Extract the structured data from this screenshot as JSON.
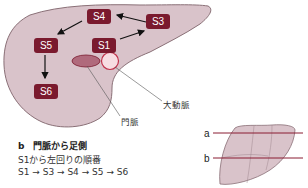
{
  "diagram": {
    "segments": [
      {
        "id": "S1",
        "label": "S1"
      },
      {
        "id": "S3",
        "label": "S3"
      },
      {
        "id": "S4",
        "label": "S4"
      },
      {
        "id": "S5",
        "label": "S5"
      },
      {
        "id": "S6",
        "label": "S6"
      }
    ],
    "annotations": {
      "aorta": "大動脈",
      "portal_vein": "門脈"
    },
    "caption": {
      "title": "b　門脈から足側",
      "line1": "S1から左回りの順番",
      "line2": "S1 → S3 → S4 → S5 → S6"
    },
    "inset": {
      "line_a": "a",
      "line_b": "b"
    },
    "colors": {
      "liver_fill": "#d9c3ca",
      "liver_stroke": "#8a7077",
      "segment_box": "#7a1a2e",
      "portal_vein": "#b06a7c",
      "aorta_fill": "#f7dde2",
      "aorta_stroke": "#c0304a",
      "section_line": "#8a1c32"
    }
  }
}
